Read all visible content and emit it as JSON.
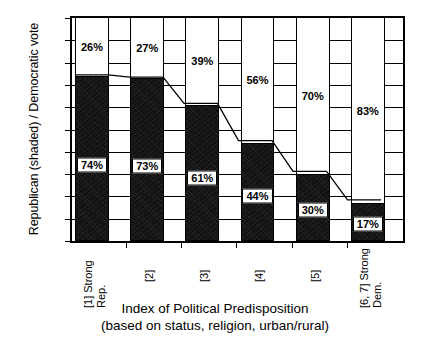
{
  "chart_data": {
    "type": "bar",
    "subtype": "stacked-bar-100",
    "title": "",
    "xlabel": "Index of Political Predisposition (based on status, religion, urban/rural)",
    "ylabel": "Republican (shaded) / Democratic vote",
    "ylim": [
      0,
      100
    ],
    "ytick_labels": [
      "100%",
      "90%",
      "80%",
      "70%",
      "60%",
      "50%",
      "40%",
      "30%",
      "20%",
      "10%",
      "0%"
    ],
    "ytick_values": [
      100,
      90,
      80,
      70,
      60,
      50,
      40,
      30,
      20,
      10,
      0
    ],
    "grid": true,
    "legend": "none",
    "categories": [
      "[1] Strong Rep.",
      "[2]",
      "[3]",
      "[4]",
      "[5]",
      "[6, 7] Strong Dem."
    ],
    "category_lines": [
      [
        "[1] Strong",
        "Rep."
      ],
      [
        "[2]"
      ],
      [
        "[3]"
      ],
      [
        "[4]"
      ],
      [
        "[5]"
      ],
      [
        "[6, 7] Strong",
        "Dem."
      ]
    ],
    "series": [
      {
        "name": "Republican (shaded)",
        "color": "#111111",
        "values": [
          74,
          73,
          61,
          44,
          30,
          17
        ],
        "labels": [
          "74%",
          "73%",
          "61%",
          "44%",
          "30%",
          "17%"
        ]
      },
      {
        "name": "Democratic vote",
        "color": "#ffffff",
        "values": [
          26,
          27,
          39,
          56,
          70,
          83
        ],
        "labels": [
          "26%",
          "27%",
          "39%",
          "56%",
          "70%",
          "83%"
        ]
      }
    ],
    "trend_line": {
      "description": "line connecting the tops of the Republican segments",
      "values": [
        74,
        73,
        61,
        44,
        30,
        17
      ]
    }
  },
  "axis_titles": {
    "y": "Republican (shaded) / Democratic vote",
    "x_line1": "Index of Political Predisposition",
    "x_line2": "(based on status, religion, urban/rural)"
  }
}
